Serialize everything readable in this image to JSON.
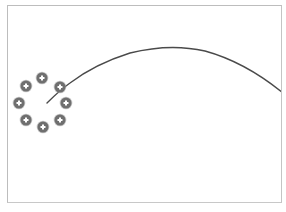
{
  "canvas": {
    "width": 286,
    "height": 212,
    "background": "#ffffff",
    "frame_border_color": "#bdbdbd"
  },
  "arc": {
    "color": "#4a4a4a",
    "stroke_width": 1.4,
    "path": "M47,103 Q60,90 70,83 Q95,64 130,53 Q170,43 205,51 Q245,62 283,93"
  },
  "marker_ring": {
    "center": [
      43,
      103
    ],
    "marker_radius": 5.5,
    "fill": "#6f6f6f",
    "edge": "#9a9a9a",
    "cross_color": "#ffffff",
    "markers": [
      {
        "name": "marker-top",
        "x": 42,
        "y": 78
      },
      {
        "name": "marker-top-right",
        "x": 60,
        "y": 87
      },
      {
        "name": "marker-right",
        "x": 66,
        "y": 103
      },
      {
        "name": "marker-bottom-right",
        "x": 60,
        "y": 120
      },
      {
        "name": "marker-bottom",
        "x": 43,
        "y": 127
      },
      {
        "name": "marker-bottom-left",
        "x": 26,
        "y": 120
      },
      {
        "name": "marker-left",
        "x": 19,
        "y": 103
      },
      {
        "name": "marker-top-left",
        "x": 26,
        "y": 86
      }
    ]
  }
}
